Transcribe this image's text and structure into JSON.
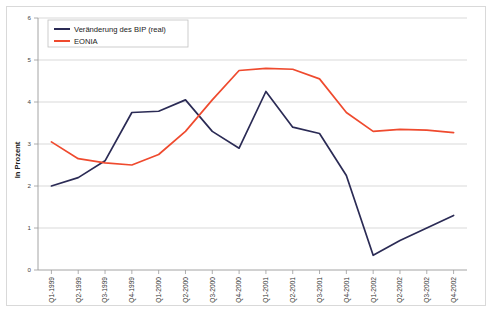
{
  "chart_data": {
    "type": "line",
    "title": "",
    "subtitle": "",
    "xlabel": "",
    "ylabel": "In Prozent",
    "ylim": [
      0,
      6
    ],
    "yticks": [
      0,
      1,
      2,
      3,
      4,
      5,
      6
    ],
    "ytick_labels": [
      "0",
      "1",
      "2",
      "3",
      "4",
      "5",
      "6"
    ],
    "grid": true,
    "legend_position": "top-left",
    "categories": [
      "Q1-1999",
      "Q2-1999",
      "Q3-1999",
      "Q4-1999",
      "Q1-2000",
      "Q2-2000",
      "Q3-2000",
      "Q4-2000",
      "Q1-2001",
      "Q2-2001",
      "Q3-2001",
      "Q4-2001",
      "Q1-2002",
      "Q2-2002",
      "Q3-2002",
      "Q4-2002"
    ],
    "series": [
      {
        "name": "Veränderung des BIP (real)",
        "color": "#2b2b55",
        "values": [
          2.0,
          2.2,
          2.6,
          3.75,
          3.78,
          4.05,
          3.3,
          2.9,
          4.25,
          3.4,
          3.25,
          2.25,
          0.35,
          0.7,
          1.0,
          1.3
        ]
      },
      {
        "name": "EONIA",
        "color": "#ef4a2e",
        "values": [
          3.05,
          2.65,
          2.55,
          2.5,
          2.75,
          3.3,
          4.05,
          4.75,
          4.8,
          4.78,
          4.55,
          3.75,
          3.3,
          3.35,
          3.33,
          3.27
        ]
      }
    ]
  },
  "legend": {
    "items": [
      {
        "label": "Veränderung des BIP (real)",
        "color": "#2b2b55"
      },
      {
        "label": "EONIA",
        "color": "#ef4a2e"
      }
    ]
  },
  "axes": {
    "y_title": "In Prozent"
  }
}
